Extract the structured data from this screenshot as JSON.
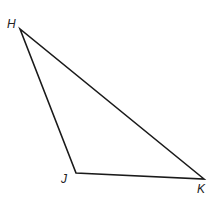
{
  "diagram": {
    "type": "triangle",
    "stroke_color": "#1a1a1a",
    "vertices": [
      {
        "label": "H",
        "x": 20,
        "y": 29,
        "label_x": 7,
        "label_y": 28
      },
      {
        "label": "J",
        "x": 76,
        "y": 173,
        "label_x": 61,
        "label_y": 183
      },
      {
        "label": "K",
        "x": 204,
        "y": 179,
        "label_x": 197,
        "label_y": 193
      }
    ]
  }
}
